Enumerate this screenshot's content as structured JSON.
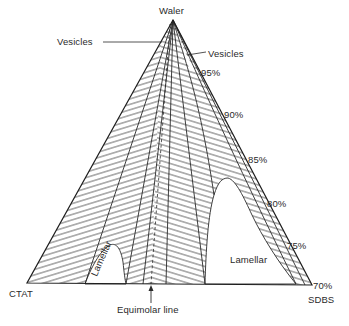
{
  "figure": {
    "type": "ternary phase diagram",
    "vertices": {
      "top": "Waler",
      "bottom_left": "CTAT",
      "bottom_right": "SDBS"
    },
    "region_labels": [
      {
        "text": "Vesicles",
        "side": "left"
      },
      {
        "text": "Vesicles",
        "side": "right"
      },
      {
        "text": "Lamellar",
        "side": "left",
        "rotated": true
      },
      {
        "text": "Lamellar",
        "side": "right"
      }
    ],
    "water_percent_ticks": [
      "95%",
      "90%",
      "85%",
      "80%",
      "75%",
      "70%"
    ],
    "annotation": "Equimolar line",
    "colors": {
      "line": "#2a2a2a",
      "background": "#ffffff"
    }
  }
}
